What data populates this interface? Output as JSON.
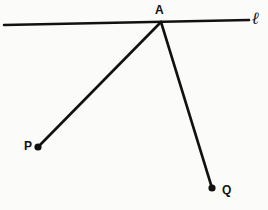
{
  "figure": {
    "background_color": "#fbfbfa",
    "ink_color": "#111111",
    "width": 268,
    "height": 210,
    "labels": {
      "vertex": "A",
      "point_p": "P",
      "point_q": "Q",
      "line": "ℓ"
    },
    "geometry": {
      "line_l": {
        "x1": 4,
        "y1": 25,
        "x2": 249,
        "y2": 20,
        "stroke_width": 2.6
      },
      "ray_ap": {
        "x1": 161,
        "y1": 22,
        "x2": 38,
        "y2": 147,
        "stroke_width": 2.6
      },
      "ray_aq": {
        "x1": 161,
        "y1": 22,
        "x2": 212,
        "y2": 188,
        "stroke_width": 2.6
      },
      "dot_p": {
        "cx": 38,
        "cy": 147,
        "r": 3.6
      },
      "dot_q": {
        "cx": 212,
        "cy": 188,
        "r": 3.6
      },
      "vertex_a": {
        "cx": 161,
        "cy": 22
      }
    },
    "label_positions": {
      "vertex": {
        "left": 155,
        "top": 4
      },
      "point_p": {
        "left": 24,
        "top": 140
      },
      "point_q": {
        "left": 222,
        "top": 184
      },
      "line": {
        "left": 252,
        "top": 10
      }
    }
  }
}
